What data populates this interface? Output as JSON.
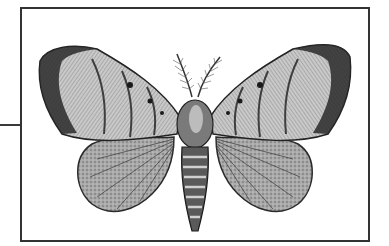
{
  "figure": {
    "colors": {
      "frame": "#333333",
      "ink_dark": "#1a1a1a",
      "ink_mid": "#6e6e6e",
      "ink_light": "#b8b8b8",
      "paper": "#ffffff"
    }
  }
}
